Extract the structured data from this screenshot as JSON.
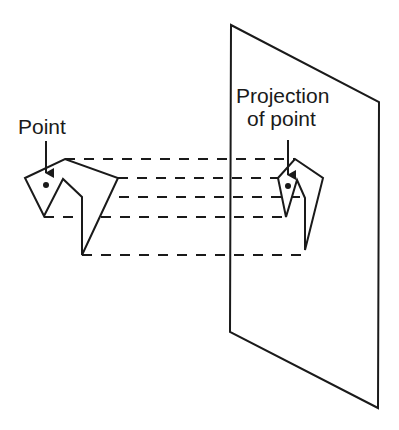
{
  "diagram": {
    "type": "orthographic-projection",
    "labels": {
      "point": "Point",
      "projection_line1": "Projection",
      "projection_line2": "of point"
    },
    "colors": {
      "stroke": "#1a1a1a",
      "background": "#ffffff"
    },
    "object_polygon": "25,178 65,159 118,178 82,255 82,197 63,179 44,216",
    "projected_polygon": "278,178 295,159 323,178 305,250 305,198 297,180 286,217",
    "plane_polygon": "231,25 379,102 378,408 230,332",
    "projection_lines_y": [
      159,
      178,
      197,
      217,
      255
    ]
  }
}
